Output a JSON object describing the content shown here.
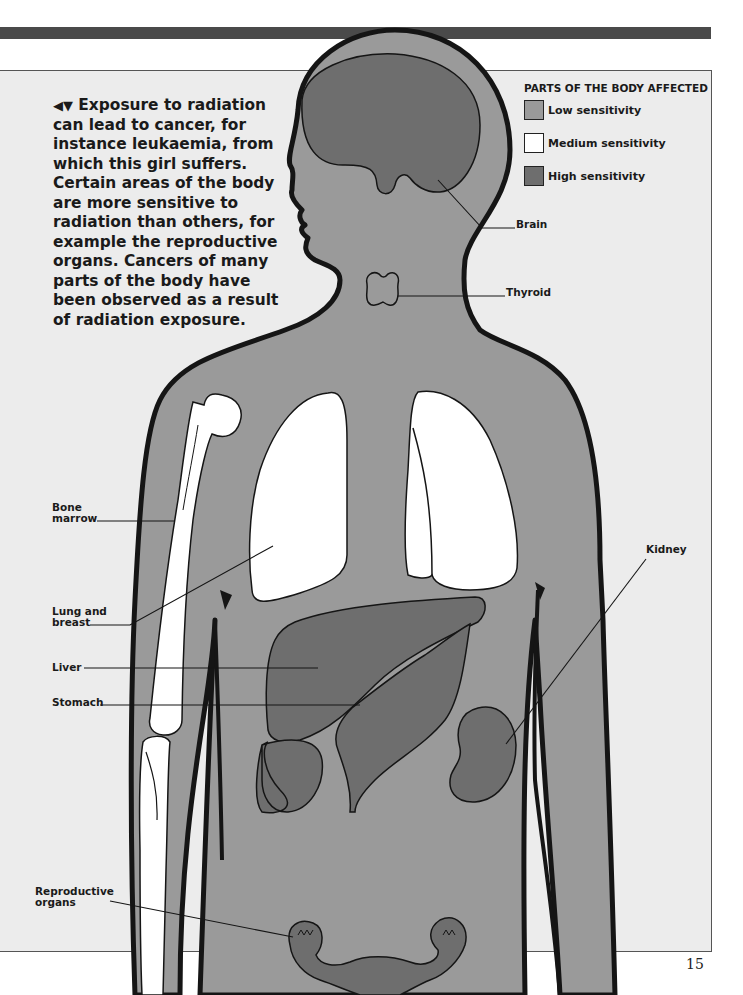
{
  "caption": {
    "arrows": "◀▼",
    "text": "Exposure to radiation can lead to cancer, for instance leukaemia, from which this girl suffers. Certain areas of the body are more sensitive to radiation than others, for example the reproductive organs. Cancers of many parts of the body have been observed as a result of radiation exposure."
  },
  "legend": {
    "title": "PARTS OF THE BODY AFFECTED",
    "items": [
      {
        "label": "Low sensitivity",
        "color": "#9a9a9a"
      },
      {
        "label": "Medium sensitivity",
        "color": "#ffffff"
      },
      {
        "label": "High sensitivity",
        "color": "#6e6e6e"
      }
    ]
  },
  "labels": {
    "brain": "Brain",
    "thyroid": "Thyroid",
    "bone_marrow_1": "Bone",
    "bone_marrow_2": "marrow",
    "lung_1": "Lung and",
    "lung_2": "breast",
    "liver": "Liver",
    "stomach": "Stomach",
    "kidney": "Kidney",
    "reproductive_1": "Reproductive",
    "reproductive_2": "organs"
  },
  "colors": {
    "body": "#9a9a9a",
    "high": "#6e6e6e",
    "medium": "#ffffff",
    "panel": "#ececec",
    "outline": "#151515"
  },
  "page_number": "15"
}
